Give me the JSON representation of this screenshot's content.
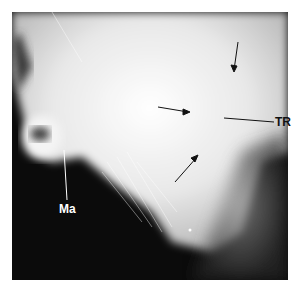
{
  "figure": {
    "type": "radiograph",
    "labels": [
      {
        "id": "ma",
        "text": "Ma"
      },
      {
        "id": "tr",
        "text": "TR"
      }
    ],
    "arrows": 3
  }
}
